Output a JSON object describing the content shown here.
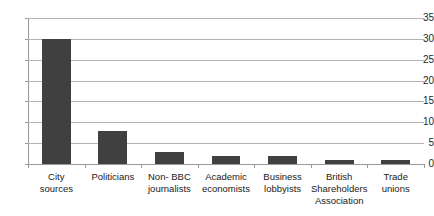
{
  "chart_data": {
    "type": "bar",
    "title": "",
    "xlabel": "",
    "ylabel": "",
    "ylim": [
      0,
      35
    ],
    "yticks": [
      0,
      5,
      10,
      15,
      20,
      25,
      30,
      35
    ],
    "grid": true,
    "legend": false,
    "orientation": "vertical",
    "bar_color": "#404040",
    "gridline_color": "#b4b4b4",
    "axis_color": "#9a9a9a",
    "background": "#ffffff",
    "categories": [
      "City sources",
      "Politicians",
      "Non- BBC journalists",
      "Academic economists",
      "Business lobbyists",
      "British Shareholders Association",
      "Trade unions"
    ],
    "category_lines": [
      [
        "City",
        "sources"
      ],
      [
        "Politicians"
      ],
      [
        "Non- BBC",
        "journalists"
      ],
      [
        "Academic",
        "economists"
      ],
      [
        "Business",
        "lobbyists"
      ],
      [
        "British",
        "Shareholders",
        "Association"
      ],
      [
        "Trade",
        "unions"
      ]
    ],
    "values": [
      30,
      8,
      3,
      2,
      2,
      1,
      1
    ]
  },
  "axis": {
    "tick_0": "0",
    "tick_5": "5",
    "tick_10": "10",
    "tick_15": "15",
    "tick_20": "20",
    "tick_25": "25",
    "tick_30": "30",
    "tick_35": "35"
  },
  "labels": {
    "cat_0_l0": "City",
    "cat_0_l1": "sources",
    "cat_1_l0": "Politicians",
    "cat_2_l0": "Non- BBC",
    "cat_2_l1": "journalists",
    "cat_3_l0": "Academic",
    "cat_3_l1": "economists",
    "cat_4_l0": "Business",
    "cat_4_l1": "lobbyists",
    "cat_5_l0": "British",
    "cat_5_l1": "Shareholders",
    "cat_5_l2": "Association",
    "cat_6_l0": "Trade",
    "cat_6_l1": "unions"
  }
}
